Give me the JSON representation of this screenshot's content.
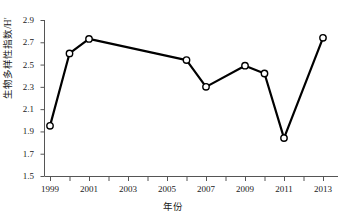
{
  "chart_data": {
    "type": "line",
    "title": "",
    "xlabel": "年份",
    "ylabel": "生物多样性指数/H′",
    "xlim": [
      1998.5,
      2013.5
    ],
    "ylim": [
      1.5,
      2.9
    ],
    "grid": false,
    "legend": null,
    "marker": "open-circle",
    "line_color": "#000000",
    "marker_fill": "#ffffff",
    "marker_edge": "#000000",
    "x": [
      1999,
      2000,
      2001,
      2006,
      2007,
      2009,
      2010,
      2011,
      2013
    ],
    "values": [
      1.95,
      2.6,
      2.73,
      2.54,
      2.3,
      2.49,
      2.42,
      1.84,
      2.74
    ],
    "series": [
      {
        "name": "生物多样性指数",
        "points": [
          {
            "x": 1999,
            "y": 1.95
          },
          {
            "x": 2000,
            "y": 2.6
          },
          {
            "x": 2001,
            "y": 2.73
          },
          {
            "x": 2006,
            "y": 2.54
          },
          {
            "x": 2007,
            "y": 2.3
          },
          {
            "x": 2009,
            "y": 2.49
          },
          {
            "x": 2010,
            "y": 2.42
          },
          {
            "x": 2011,
            "y": 1.84
          },
          {
            "x": 2013,
            "y": 2.74
          }
        ]
      }
    ],
    "ytick_labels": [
      "1.5",
      "1.7",
      "1.9",
      "2.1",
      "2.3",
      "2.5",
      "2.7",
      "2.9"
    ],
    "ytick_values": [
      1.5,
      1.7,
      1.9,
      2.1,
      2.3,
      2.5,
      2.7,
      2.9
    ],
    "xtick_values": [
      1999,
      2000,
      2001,
      2002,
      2003,
      2004,
      2005,
      2006,
      2007,
      2008,
      2009,
      2010,
      2011,
      2012,
      2013
    ],
    "xtick_labels": [
      "1999",
      "",
      "2001",
      "",
      "2003",
      "",
      "2005",
      "",
      "2007",
      "",
      "2009",
      "",
      "2011",
      "",
      "2013"
    ],
    "xtick_labeled": [
      "1999",
      "2001",
      "2003",
      "2005",
      "2007",
      "2009",
      "2011",
      "2013"
    ],
    "xtick_labeled_values": [
      1999,
      2001,
      2003,
      2005,
      2007,
      2009,
      2011,
      2013
    ]
  }
}
